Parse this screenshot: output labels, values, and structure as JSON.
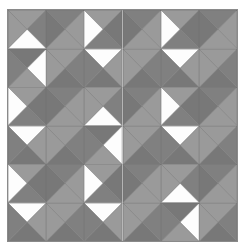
{
  "figure": {
    "name": "quilt-block-pattern",
    "canvas": {
      "width": 244,
      "height": 250,
      "background": "#ffffff"
    },
    "grid": {
      "origin_x": 8,
      "origin_y": 10,
      "cols": 6,
      "rows": 6,
      "cell_width": 38.2,
      "cell_height": 38.5,
      "seam_color": "#6f6f6f",
      "outline_color": "#8a8a8a"
    },
    "palette": {
      "white": "#fdfdfd",
      "light_gray": "#b9b9b9",
      "medium_gray": "#9a9a9a",
      "dark_gray": "#808080",
      "hatch_gray": "#7a7a7a",
      "seam": "#6f6f6f"
    },
    "legend": {
      "white_label": "white",
      "medium_label": "medium gray",
      "dark_label": "dark hatched gray"
    },
    "motif": {
      "repeat_cols": 2,
      "repeat_rows": 2,
      "description": "eight-pointed pinwheel star"
    },
    "cells": [
      [
        "MDWM",
        "DMMH",
        "MHDW",
        "DMMH",
        "MHDW",
        "DMMH"
      ],
      [
        "HWMD",
        "MDHM",
        "WMHD",
        "MDHM",
        "WMHD",
        "MDHM"
      ],
      [
        "MHDW",
        "DMMH",
        "MDWM",
        "DMMH",
        "MHDW",
        "DMMH"
      ],
      [
        "WMHD",
        "MDHM",
        "HWMD",
        "MDHM",
        "WMHD",
        "MDHM"
      ],
      [
        "MHDW",
        "DMMH",
        "MHDW",
        "DMMH",
        "MDWM",
        "DMMH"
      ],
      [
        "WMHD",
        "MDHM",
        "WMHD",
        "MDHM",
        "HWMD",
        "MDHM"
      ]
    ]
  }
}
